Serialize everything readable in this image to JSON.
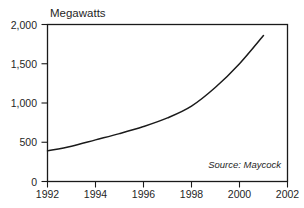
{
  "chart_data": {
    "type": "line",
    "title": "",
    "ylabel": "Megawatts",
    "xlabel": "",
    "annotation": "Source: Maycock",
    "grid": false,
    "legend": false,
    "xlim": [
      1992,
      2002
    ],
    "ylim": [
      0,
      2000
    ],
    "x_ticks": [
      "1992",
      "1994",
      "1996",
      "1998",
      "2000",
      "2002"
    ],
    "x_tick_values": [
      1992,
      1994,
      1996,
      1998,
      2000,
      2002
    ],
    "y_ticks": [
      "0",
      "500",
      "1,000",
      "1,500",
      "2,000"
    ],
    "y_tick_values": [
      0,
      500,
      1000,
      1500,
      2000
    ],
    "x": [
      1992,
      1993,
      1994,
      1995,
      1996,
      1997,
      1998,
      1999,
      2000,
      2001
    ],
    "values": [
      390,
      450,
      530,
      610,
      700,
      810,
      960,
      1200,
      1500,
      1860
    ],
    "series": [
      {
        "name": "Megawatts",
        "values": [
          390,
          450,
          530,
          610,
          700,
          810,
          960,
          1200,
          1500,
          1860
        ],
        "color": "#1a1a1a"
      }
    ]
  },
  "figure": {
    "background": "#ffffff",
    "line_color": "#1a1a1a",
    "axis_color": "#1a1a1a"
  }
}
